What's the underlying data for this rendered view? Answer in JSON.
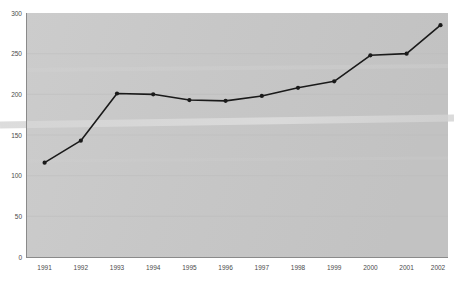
{
  "figure": {
    "title_remnant": "",
    "background_color": "#ffffff",
    "plot_background_color": "#c9c9c9"
  },
  "axes": {
    "y_ticks": [
      "0",
      "50",
      "100",
      "150",
      "200",
      "250",
      "300"
    ],
    "x_ticks": [
      "1991",
      "1992",
      "1993",
      "1994",
      "1995",
      "1996",
      "1997",
      "1998",
      "1999",
      "2000",
      "2001",
      "2002"
    ],
    "axis_line_color": "#8a8a8a",
    "gridline_color": "#bdbdbd",
    "tick_label_color": "#4a4a4a"
  },
  "series_style": {
    "line_color": "#1a1a1a",
    "marker_color": "#1a1a1a",
    "line_width": 1.6,
    "marker_radius": 2.1
  },
  "chart_data": {
    "type": "line",
    "title": "",
    "subtitle": "",
    "xlabel": "",
    "ylabel": "",
    "x": [
      "1991",
      "1992",
      "1993",
      "1994",
      "1995",
      "1996",
      "1997",
      "1998",
      "1999",
      "2000",
      "2001",
      "2002"
    ],
    "values": [
      116,
      143,
      201,
      200,
      193,
      192,
      198,
      208,
      216,
      248,
      250,
      285
    ],
    "series": [
      {
        "name": "Series 1",
        "values": [
          116,
          143,
          201,
          200,
          193,
          192,
          198,
          208,
          216,
          248,
          250,
          285
        ]
      }
    ],
    "ylim": [
      0,
      300
    ],
    "ytick_interval": 50,
    "grid": true,
    "grid_axis": "y",
    "legend": false,
    "legend_position": "none",
    "markers": true,
    "annotations": []
  }
}
